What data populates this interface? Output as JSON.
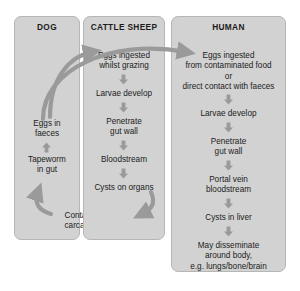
{
  "diagram": {
    "colors": {
      "panel_fill": "#d2d2d2",
      "panel_border": "#b6b6b6",
      "arrow": "#9a9a9a",
      "text": "#1c1c1c",
      "background": "#ffffff"
    }
  },
  "columns": {
    "dog": {
      "title": "DOG",
      "steps": [
        {
          "label": "Eggs in\nfaeces"
        },
        {
          "label": "Tapeworm\nin gut"
        },
        {
          "label": "Contaminated\ncarcass eaten"
        }
      ]
    },
    "cattle_sheep": {
      "title": "CATTLE SHEEP",
      "steps": [
        {
          "label": "Eggs ingested\nwhilst grazing"
        },
        {
          "label": "Larvae develop"
        },
        {
          "label": "Penetrate\ngut wall"
        },
        {
          "label": "Bloodstream"
        },
        {
          "label": "Cysts on organs"
        }
      ]
    },
    "human": {
      "title": "HUMAN",
      "steps": [
        {
          "label": "Eggs ingested\nfrom contaminated food\nor\ndirect contact with faeces"
        },
        {
          "label": "Larvae develop"
        },
        {
          "label": "Penetrate\ngut wall"
        },
        {
          "label": "Portal vein\nbloodstream"
        },
        {
          "label": "Cysts in liver"
        },
        {
          "label": "May disseminate\naround body,\ne.g. lungs/bone/brain"
        }
      ]
    }
  },
  "connections": [
    {
      "name": "dog-eggs-to-cattle",
      "from": "Eggs in faeces",
      "to": "Eggs ingested whilst grazing",
      "style": "curved"
    },
    {
      "name": "dog-eggs-to-human",
      "from": "Eggs in faeces",
      "to": "Eggs ingested from contaminated food",
      "style": "curved"
    },
    {
      "name": "cysts-to-carcass",
      "from": "Cysts on organs",
      "to": "Contaminated carcass eaten",
      "style": "curved"
    },
    {
      "name": "carcass-to-tapeworm",
      "from": "Contaminated carcass eaten",
      "to": "Tapeworm in gut",
      "style": "curved"
    },
    {
      "name": "tapeworm-to-eggs",
      "from": "Tapeworm in gut",
      "to": "Eggs in faeces",
      "style": "straight-up"
    }
  ]
}
